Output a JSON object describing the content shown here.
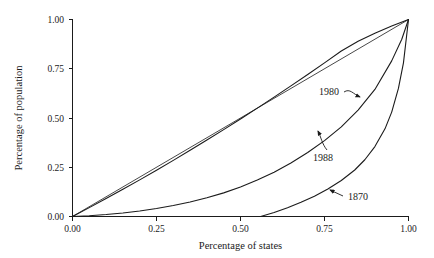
{
  "chart_data": {
    "type": "line",
    "title": "",
    "subtitle": "",
    "xlabel": "Percentage of states",
    "ylabel": "Percentage of population",
    "xlim": [
      0.0,
      1.0
    ],
    "ylim": [
      0.0,
      1.0
    ],
    "grid": false,
    "legend_position": "inline-annotations",
    "xticks": [
      "0.00",
      "0.25",
      "0.50",
      "0.75",
      "1.00"
    ],
    "xtick_values": [
      0.0,
      0.25,
      0.5,
      0.75,
      1.0
    ],
    "yticks": [
      "0.00",
      "0.25",
      "0.50",
      "0.75",
      "1.00"
    ],
    "ytick_values": [
      0.0,
      0.25,
      0.5,
      0.75,
      1.0
    ],
    "annotations": [
      {
        "label": "1980",
        "points_to_series": "1980",
        "x": 0.81,
        "y": 0.585
      },
      {
        "label": "1988",
        "points_to_series": "1988",
        "x": 0.755,
        "y": 0.3
      },
      {
        "label": "1870",
        "points_to_series": "1870",
        "x": 0.815,
        "y": 0.145
      }
    ],
    "series": [
      {
        "name": "1980",
        "x": [
          0.0,
          0.05,
          0.1,
          0.15,
          0.2,
          0.25,
          0.3,
          0.35,
          0.4,
          0.45,
          0.5,
          0.55,
          0.6,
          0.65,
          0.7,
          0.75,
          0.8,
          0.85,
          0.9,
          0.95,
          1.0
        ],
        "y": [
          0.0,
          0.045,
          0.091,
          0.138,
          0.186,
          0.235,
          0.285,
          0.336,
          0.388,
          0.441,
          0.495,
          0.55,
          0.606,
          0.663,
          0.721,
          0.78,
          0.84,
          0.89,
          0.93,
          0.967,
          1.0
        ]
      },
      {
        "name": "1988",
        "x": [
          0.0,
          0.05,
          0.1,
          0.15,
          0.2,
          0.25,
          0.3,
          0.35,
          0.4,
          0.45,
          0.5,
          0.55,
          0.6,
          0.65,
          0.7,
          0.75,
          0.8,
          0.85,
          0.9,
          0.95,
          0.98,
          1.0
        ],
        "y": [
          0.0,
          0.004,
          0.01,
          0.018,
          0.028,
          0.041,
          0.056,
          0.074,
          0.095,
          0.12,
          0.15,
          0.185,
          0.225,
          0.272,
          0.325,
          0.385,
          0.455,
          0.54,
          0.645,
          0.79,
          0.9,
          1.0
        ]
      },
      {
        "name": "1870",
        "x": [
          0.56,
          0.6,
          0.64,
          0.68,
          0.72,
          0.76,
          0.8,
          0.84,
          0.87,
          0.9,
          0.93,
          0.95,
          0.97,
          0.985,
          1.0
        ],
        "y": [
          0.0,
          0.02,
          0.044,
          0.072,
          0.103,
          0.14,
          0.183,
          0.236,
          0.288,
          0.355,
          0.445,
          0.53,
          0.65,
          0.78,
          1.0
        ]
      },
      {
        "name": "equality-line",
        "x": [
          0.0,
          1.0
        ],
        "y": [
          0.0,
          1.0
        ]
      }
    ]
  }
}
